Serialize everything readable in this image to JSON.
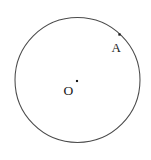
{
  "figure": {
    "type": "geometry-diagram",
    "background_color": "#ffffff",
    "stroke_color": "#4a4a4a",
    "point_color": "#1a1a1a",
    "canvas": {
      "width": 151,
      "height": 160
    },
    "circle": {
      "name": "main-circle",
      "center_x": 77.5,
      "center_y": 80,
      "radius": 62.5,
      "stroke_width": 1.05
    },
    "points": [
      {
        "id": "center",
        "label": "O",
        "dot_x": 77,
        "dot_y": 81,
        "dot_size": 2.1,
        "label_x": 63.5,
        "label_y": 95,
        "on_circle": false
      },
      {
        "id": "point-a",
        "label": "A",
        "dot_x": 119.5,
        "dot_y": 34.5,
        "dot_size": 2.3,
        "label_x": 111.5,
        "label_y": 52,
        "on_circle": true
      }
    ]
  }
}
